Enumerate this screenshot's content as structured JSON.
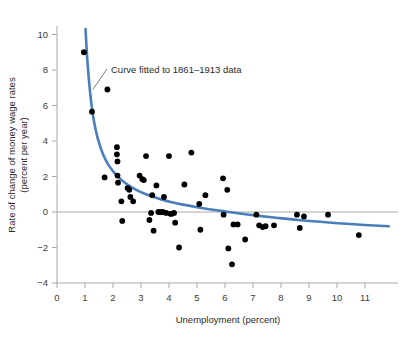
{
  "chart_data": {
    "type": "scatter",
    "title": "",
    "xlabel": "Unemployment (percent)",
    "ylabel": "Rate of change of money wage rates (percent per year)",
    "ylabel_line1": "Rate of change of money wage rates",
    "ylabel_line2": "(percent per year)",
    "xlim": [
      0,
      11.9
    ],
    "ylim": [
      -4,
      10.6
    ],
    "xticks": [
      0,
      1,
      2,
      3,
      4,
      5,
      6,
      7,
      8,
      9,
      10,
      11
    ],
    "xtick_labels": [
      "0",
      "1",
      "2",
      "3",
      "4",
      "5",
      "6",
      "7",
      "8",
      "9",
      "10",
      "11"
    ],
    "yticks": [
      -4,
      -2,
      0,
      2,
      4,
      6,
      8,
      10
    ],
    "ytick_labels": [
      "−4",
      "−2",
      "0",
      "2",
      "4",
      "6",
      "8",
      "10"
    ],
    "grid": false,
    "zero_line": true,
    "legend": "none",
    "annotations": [
      {
        "text": "Curve fitted to 1861–1913 data",
        "x": 2.0,
        "y": 8.0,
        "points_to_x": 1.28,
        "points_to_y": 6.9
      }
    ],
    "series": [
      {
        "name": "Phillips curve fit",
        "type": "line",
        "color": "#4a7ebb",
        "points": [
          [
            1.02,
            10.3
          ],
          [
            1.05,
            9.4
          ],
          [
            1.1,
            8.2
          ],
          [
            1.16,
            7.1
          ],
          [
            1.22,
            6.2
          ],
          [
            1.3,
            5.3
          ],
          [
            1.4,
            4.5
          ],
          [
            1.52,
            3.8
          ],
          [
            1.66,
            3.2
          ],
          [
            1.82,
            2.7
          ],
          [
            2.0,
            2.3
          ],
          [
            2.2,
            1.95
          ],
          [
            2.45,
            1.62
          ],
          [
            2.72,
            1.35
          ],
          [
            3.0,
            1.12
          ],
          [
            3.35,
            0.9
          ],
          [
            3.7,
            0.72
          ],
          [
            4.1,
            0.55
          ],
          [
            4.55,
            0.4
          ],
          [
            5.0,
            0.27
          ],
          [
            5.5,
            0.14
          ],
          [
            6.0,
            0.03
          ],
          [
            6.6,
            -0.1
          ],
          [
            7.2,
            -0.22
          ],
          [
            7.9,
            -0.34
          ],
          [
            8.6,
            -0.45
          ],
          [
            9.4,
            -0.55
          ],
          [
            10.2,
            -0.65
          ],
          [
            11.0,
            -0.73
          ],
          [
            11.85,
            -0.8
          ]
        ]
      },
      {
        "name": "Annual observations 1861–1913",
        "type": "scatter",
        "color": "#000000",
        "x": [
          0.96,
          1.25,
          1.8,
          1.7,
          2.14,
          2.14,
          2.16,
          2.16,
          2.18,
          2.3,
          2.33,
          2.52,
          2.58,
          2.62,
          2.72,
          2.95,
          3.05,
          3.1,
          3.18,
          3.3,
          3.36,
          3.4,
          3.45,
          3.55,
          3.62,
          3.7,
          3.78,
          3.82,
          3.9,
          4.0,
          4.05,
          4.1,
          4.18,
          4.22,
          4.36,
          4.55,
          4.8,
          5.08,
          5.12,
          5.3,
          5.93,
          5.95,
          6.08,
          6.12,
          6.25,
          6.3,
          6.45,
          6.72,
          7.12,
          7.22,
          7.35,
          7.45,
          7.75,
          8.57,
          8.67,
          8.82,
          9.68,
          10.78
        ],
        "y": [
          9.0,
          5.65,
          6.9,
          1.95,
          3.65,
          3.25,
          2.85,
          2.05,
          1.65,
          0.6,
          -0.5,
          1.35,
          1.25,
          0.85,
          0.6,
          2.05,
          1.85,
          1.8,
          3.15,
          -0.45,
          -0.05,
          0.95,
          -1.05,
          1.5,
          0.0,
          0.0,
          0.0,
          0.85,
          -0.05,
          3.15,
          -0.1,
          -0.1,
          -0.05,
          -0.6,
          -2.0,
          1.55,
          3.35,
          0.45,
          -1.0,
          0.95,
          1.9,
          -0.15,
          1.25,
          -2.05,
          -2.95,
          -0.7,
          -0.7,
          -1.55,
          -0.15,
          -0.75,
          -0.85,
          -0.8,
          -0.75,
          -0.15,
          -0.9,
          -0.25,
          -0.15,
          -1.3
        ]
      }
    ]
  },
  "axes": {
    "x_axis_name": "unemployment-axis",
    "y_axis_name": "wage-change-axis"
  },
  "colors": {
    "curve": "#4a7ebb",
    "points": "#000000",
    "axis": "#a8a8a8",
    "text": "#2b2b2b",
    "background": "#ffffff"
  }
}
